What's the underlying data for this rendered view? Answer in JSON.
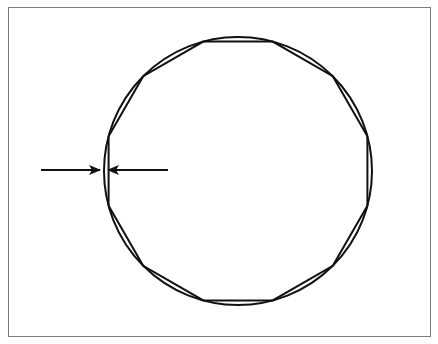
{
  "figure": {
    "stroke_color": "#111111",
    "frame_color": "#7a7a7a",
    "circle": {
      "cx": 238,
      "cy": 171,
      "r": 134
    },
    "polygon": {
      "sides": 12,
      "rotation_deg": 15
    },
    "arrows": [
      {
        "name": "left-arrow",
        "x1": 41,
        "x2": 100,
        "y": 170,
        "direction": "right"
      },
      {
        "name": "right-arrow",
        "x1": 168,
        "x2": 108,
        "y": 170,
        "direction": "left"
      }
    ]
  },
  "caption": ""
}
